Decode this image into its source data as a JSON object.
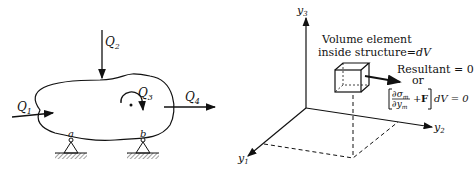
{
  "left_figure": {
    "loads": {
      "q1": {
        "label": "Q",
        "sub": "1"
      },
      "q2": {
        "label": "Q",
        "sub": "2"
      },
      "q3": {
        "label": "Q",
        "sub": "3"
      },
      "q4": {
        "label": "Q",
        "sub": "4"
      }
    },
    "supports": {
      "a": "a",
      "b": "b"
    }
  },
  "right_figure": {
    "axes": {
      "y1": {
        "label": "y",
        "sub": "1"
      },
      "y2": {
        "label": "y",
        "sub": "2"
      },
      "y3": {
        "label": "y",
        "sub": "3"
      }
    },
    "volume_label_line1": "Volume element",
    "volume_label_line2": "inside structure",
    "volume_label_eq": "=",
    "volume_label_dv": "dV",
    "resultant_line": "Resultant = 0",
    "or_text": "or",
    "equation": {
      "num": "∂σ",
      "num_sub": "m",
      "den": "∂y",
      "den_sub": "m",
      "plus": "+",
      "force": "F",
      "tail": "dV = 0"
    }
  }
}
